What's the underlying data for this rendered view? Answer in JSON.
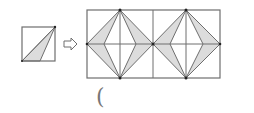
{
  "figure": {
    "colors": {
      "line": "#6e6e6e",
      "fill": "#dcdcdc",
      "dot": "#222222",
      "background": "#ffffff"
    },
    "small_square": {
      "x": 22,
      "y": 27,
      "size": 34
    },
    "arrow_icon": "hollow-right-arrow",
    "grid": {
      "x": 87,
      "y": 10,
      "width": 133,
      "height": 68,
      "columns": 4,
      "rows": 2
    },
    "answer_paren": "("
  }
}
